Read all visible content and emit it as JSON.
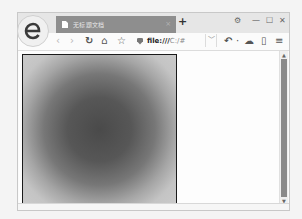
{
  "browser": {
    "logo_icon": "ie-style-e-logo",
    "tab": {
      "title": "无标题文档",
      "icon": "page-icon",
      "close_label": "×"
    },
    "new_tab_label": "+",
    "window_controls": {
      "settings_label": "⚙",
      "minimize_label": "—",
      "maximize_label": "☐",
      "close_label": "✕"
    },
    "toolbar": {
      "back_label": "‹",
      "forward_label": "›",
      "reload_label": "↻",
      "home_label": "⌂",
      "favorite_label": "☆",
      "address_scheme": "file:///",
      "address_path": "C:/#",
      "address_dropdown_label": "﹀",
      "undo_label": "↶",
      "dot_label": "·",
      "cloud_label": "☁",
      "phone_label": "▯",
      "menu_label": "≡"
    }
  },
  "page": {
    "canvas": {
      "description": "radial gradient circle",
      "center_color": "#4a4a4a",
      "edge_color": "#cacaca",
      "border_color": "#1a1a1a"
    }
  },
  "scrollbar": {
    "up_label": "▲",
    "down_label": "▼",
    "thumb_color": "#8a8a8a"
  }
}
